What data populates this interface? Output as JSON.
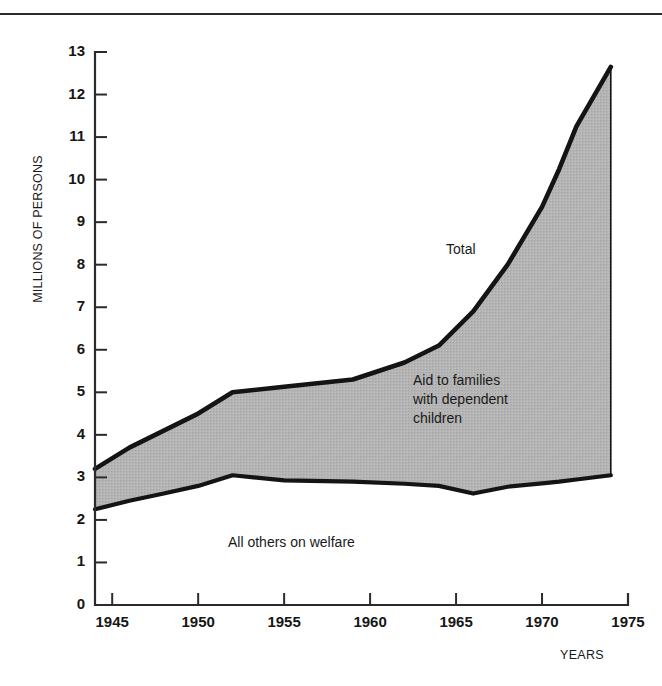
{
  "figure": {
    "background": "#ffffff",
    "rule_color": "#2b2b2b"
  },
  "axes": {
    "y_title": "MILLIONS OF PERSONS",
    "x_title": "YEARS",
    "y_ticks": [
      "0",
      "1",
      "2",
      "3",
      "4",
      "5",
      "6",
      "7",
      "8",
      "9",
      "10",
      "11",
      "12",
      "13"
    ],
    "x_ticks": [
      "1945",
      "1950",
      "1955",
      "1960",
      "1965",
      "1970",
      "1975"
    ]
  },
  "annotations": {
    "total": "Total",
    "afdc": "Aid to families\nwith dependent\nchildren",
    "others": "All others on welfare"
  },
  "chart_data": {
    "type": "area",
    "title": "",
    "subtitle": "",
    "xlabel": "YEARS",
    "ylabel": "MILLIONS OF PERSONS",
    "xlim": [
      1944,
      1975
    ],
    "ylim": [
      0,
      13
    ],
    "grid": false,
    "legend": "inline-annotations",
    "stacked": true,
    "fill_color": "#b2b2b2",
    "line_color": "#141414",
    "x": [
      1944,
      1946,
      1948,
      1950,
      1952,
      1955,
      1959,
      1962,
      1964,
      1966,
      1968,
      1970,
      1971,
      1972,
      1974
    ],
    "series": [
      {
        "name": "All others on welfare",
        "description": "Lower boundary curve: welfare recipients other than AFDC",
        "values": [
          2.25,
          2.45,
          2.62,
          2.8,
          3.05,
          2.93,
          2.9,
          2.85,
          2.8,
          2.62,
          2.78,
          2.86,
          2.9,
          2.95,
          3.05
        ]
      },
      {
        "name": "Aid to families with dependent children",
        "description": "Shaded band between the lower curve and the Total curve",
        "values": [
          0.95,
          1.25,
          1.48,
          1.7,
          1.95,
          2.2,
          2.4,
          2.85,
          3.3,
          4.28,
          5.22,
          6.5,
          7.35,
          8.3,
          9.6
        ]
      }
    ],
    "total": {
      "name": "Total",
      "values": [
        3.2,
        3.7,
        4.1,
        4.5,
        5.0,
        5.13,
        5.3,
        5.7,
        6.1,
        6.9,
        8.0,
        9.36,
        10.25,
        11.25,
        12.65
      ]
    }
  }
}
